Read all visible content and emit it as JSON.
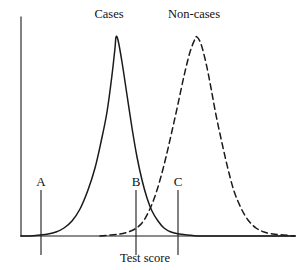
{
  "figure": {
    "background_color": "#ffffff",
    "ink_color": "#1a1a1a",
    "width": 301,
    "height": 270
  },
  "axes": {
    "y_axis": {
      "x": 21,
      "y_top": 17,
      "y_bottom": 236
    },
    "x_axis": {
      "y": 236,
      "x_left": 21,
      "x_right": 295
    },
    "xlabel": "Test score",
    "xlabel_x": 145,
    "xlabel_y": 252
  },
  "curve_labels": [
    {
      "name": "cases",
      "text": "Cases",
      "x": 109,
      "y": 8
    },
    {
      "name": "non-cases",
      "text": "Non-cases",
      "x": 194,
      "y": 8
    }
  ],
  "markers": [
    {
      "name": "a",
      "label": "A",
      "x": 41,
      "label_y": 175,
      "line_top": 190,
      "line_bottom": 255
    },
    {
      "name": "b",
      "label": "B",
      "x": 136,
      "label_y": 175,
      "line_top": 190,
      "line_bottom": 255
    },
    {
      "name": "c",
      "label": "C",
      "x": 178,
      "label_y": 175,
      "line_top": 190,
      "line_bottom": 255
    }
  ],
  "chart_data": {
    "type": "line",
    "title": "",
    "xlabel": "Test score",
    "ylabel": "",
    "grid": false,
    "legend": "inline-labels-above-curves",
    "axis_ranges": {
      "x_pixels": [
        21,
        295
      ],
      "y_pixels": [
        236,
        36
      ]
    },
    "annotations": [
      {
        "label": "A",
        "x_pixel": 41,
        "description": "low cut-off marker, left of both distributions"
      },
      {
        "label": "B",
        "x_pixel": 136,
        "description": "middle cut-off marker, right flank of Cases curve"
      },
      {
        "label": "C",
        "x_pixel": 178,
        "description": "high cut-off marker, right of curve intersection"
      },
      {
        "label": "intersection",
        "x_pixel": 152,
        "y_pixel": 190,
        "description": "crossing point of Cases and Non-cases curves"
      }
    ],
    "series": [
      {
        "name": "Cases",
        "style": "solid",
        "color": "#1a1a1a",
        "peak": {
          "x": 115,
          "y": 36
        },
        "baseline_y": 236,
        "points": [
          [
            21,
            236
          ],
          [
            30,
            236
          ],
          [
            40,
            235
          ],
          [
            48,
            234
          ],
          [
            56,
            232
          ],
          [
            64,
            228
          ],
          [
            72,
            221
          ],
          [
            80,
            209
          ],
          [
            88,
            190
          ],
          [
            95,
            168
          ],
          [
            101,
            142
          ],
          [
            107,
            112
          ],
          [
            112,
            75
          ],
          [
            115,
            48
          ],
          [
            116,
            37
          ],
          [
            118,
            40
          ],
          [
            122,
            62
          ],
          [
            127,
            95
          ],
          [
            132,
            128
          ],
          [
            137,
            157
          ],
          [
            142,
            180
          ],
          [
            147,
            198
          ],
          [
            152,
            211
          ],
          [
            158,
            221
          ],
          [
            164,
            228
          ],
          [
            171,
            232
          ],
          [
            179,
            234
          ],
          [
            188,
            235
          ],
          [
            198,
            236
          ],
          [
            220,
            236
          ],
          [
            260,
            236
          ],
          [
            295,
            236
          ]
        ]
      },
      {
        "name": "Non-cases",
        "style": "dashed",
        "color": "#1a1a1a",
        "peak": {
          "x": 196,
          "y": 37
        },
        "baseline_y": 236,
        "points": [
          [
            100,
            236
          ],
          [
            110,
            235
          ],
          [
            120,
            234
          ],
          [
            128,
            232
          ],
          [
            135,
            229
          ],
          [
            142,
            223
          ],
          [
            148,
            213
          ],
          [
            154,
            199
          ],
          [
            160,
            180
          ],
          [
            166,
            157
          ],
          [
            172,
            131
          ],
          [
            178,
            104
          ],
          [
            184,
            76
          ],
          [
            190,
            52
          ],
          [
            195,
            39
          ],
          [
            197,
            37
          ],
          [
            201,
            44
          ],
          [
            206,
            63
          ],
          [
            211,
            88
          ],
          [
            216,
            115
          ],
          [
            222,
            143
          ],
          [
            228,
            169
          ],
          [
            234,
            191
          ],
          [
            241,
            208
          ],
          [
            248,
            220
          ],
          [
            256,
            228
          ],
          [
            264,
            232
          ],
          [
            273,
            234
          ],
          [
            283,
            235
          ],
          [
            295,
            236
          ]
        ]
      }
    ]
  }
}
